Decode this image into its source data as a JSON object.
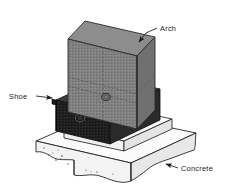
{
  "figure": {
    "name": "arch-shoe-concrete-foundation-detail",
    "background_color": "#ffffff",
    "line_color": "#1a1a1a"
  },
  "labels": {
    "arch": "Arch",
    "shoe": "Shoe",
    "concrete": "Concrete"
  },
  "parts": {
    "arch": {
      "name": "arch",
      "label": "Arch",
      "top_face_color": "#8a8a8a",
      "left_face_color": "#6f6f6f",
      "right_face_color": "#7d7d7d"
    },
    "shoe": {
      "name": "shoe",
      "label": "Shoe",
      "front_face_color": "#1c1c1c",
      "right_face_color": "#2e2e2e",
      "top_face_color": "#3a3a3a"
    },
    "concrete": {
      "name": "concrete",
      "label": "Concrete",
      "top_face_color": "#fbfbfb",
      "front_face_color": "#f2f2f2",
      "right_face_color": "#e6e6e6",
      "pedestal_color": "#fafafa"
    }
  },
  "leaders": {
    "arch": {
      "name": "arch-leader",
      "arrow_tip_x": 138,
      "arrow_tip_y": 43,
      "elbow_x": 152,
      "elbow_y": 29,
      "text_x": 160,
      "text_y": 29
    },
    "shoe": {
      "name": "shoe-leader",
      "arrow_tip_x": 59,
      "arrow_tip_y": 99,
      "elbow_x": 40,
      "elbow_y": 96,
      "text_x": 9,
      "text_y": 96
    },
    "concrete": {
      "name": "concrete-leader",
      "arrow_tip_x": 160,
      "arrow_tip_y": 162,
      "elbow_x": 174,
      "elbow_y": 168,
      "text_x": 180,
      "text_y": 169
    }
  },
  "details": {
    "arch_bolt_hole": {
      "cx": 106,
      "cy": 97,
      "rx": 4.4,
      "ry": 3.6
    },
    "shoe_bolt_hole": {
      "cx": 80,
      "cy": 118,
      "rx": 4.6,
      "ry": 3.8
    },
    "aggregate_speckle_count": 9
  }
}
